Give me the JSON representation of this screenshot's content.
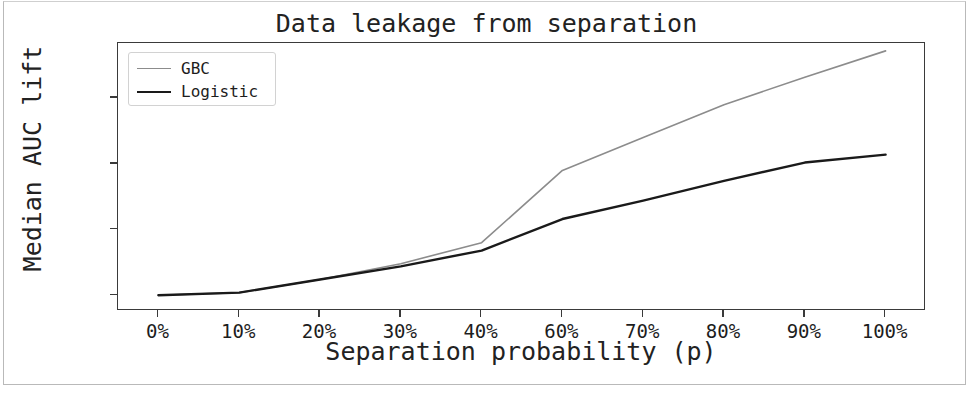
{
  "chart_data": {
    "type": "line",
    "title": "Data leakage from separation",
    "xlabel": "Separation probability (p)",
    "ylabel": "Median AUC lift",
    "categories": [
      "0%",
      "10%",
      "20%",
      "30%",
      "40%",
      "60%",
      "70%",
      "80%",
      "90%",
      "100%"
    ],
    "yticks": [
      "1.00",
      "1.05",
      "1.10",
      "1.15"
    ],
    "ytick_values": [
      1.0,
      1.05,
      1.1,
      1.15
    ],
    "ylim": [
      0.988,
      1.192
    ],
    "grid": false,
    "legend_position": "upper left",
    "series": [
      {
        "name": "GBC",
        "color": "#8c8c8c",
        "linewidth": 1.6,
        "values": [
          1.0,
          1.002,
          1.012,
          1.024,
          1.04,
          1.095,
          1.12,
          1.145,
          1.166,
          1.186
        ]
      },
      {
        "name": "Logistic",
        "color": "#1a1a1a",
        "linewidth": 2.4,
        "values": [
          1.0,
          1.002,
          1.012,
          1.022,
          1.034,
          1.058,
          1.072,
          1.087,
          1.101,
          1.107
        ]
      }
    ]
  },
  "legend": {
    "items": [
      {
        "label": "GBC"
      },
      {
        "label": "Logistic"
      }
    ]
  }
}
